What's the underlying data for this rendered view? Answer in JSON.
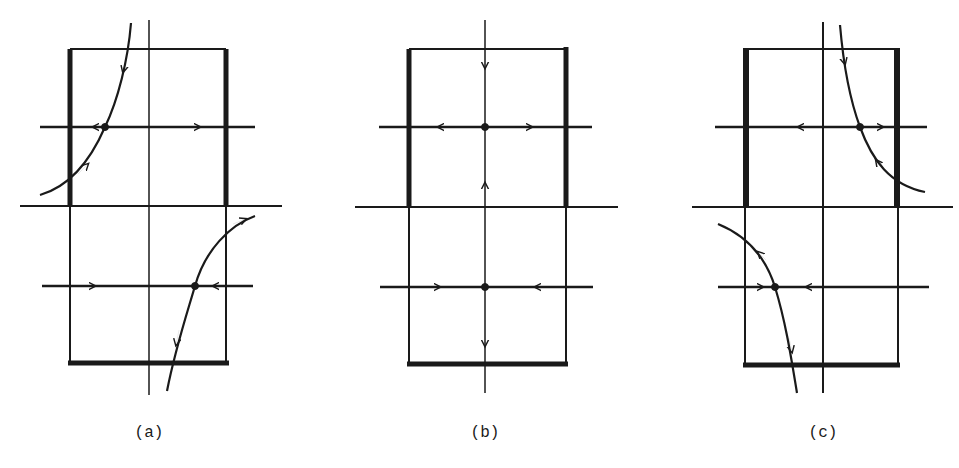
{
  "figure": {
    "panels": [
      {
        "id": "a",
        "label": "(a)",
        "label_pos": {
          "x": 149,
          "y": 424
        },
        "rect": {
          "left": 70,
          "right": 226,
          "top": 49,
          "mid": 206,
          "bottom": 363
        },
        "axis_x": 149,
        "thick_edges": [
          "left-upper",
          "right-upper",
          "bottom"
        ],
        "equilibria": [
          {
            "x": 105,
            "y": 127
          },
          {
            "x": 195,
            "y": 286
          }
        ],
        "description": "Upper saddle near left edge with trajectory curving down from top-left; lower saddle near right with trajectory exiting bottom"
      },
      {
        "id": "b",
        "label": "(b)",
        "label_pos": {
          "x": 485,
          "y": 424
        },
        "rect": {
          "left": 409,
          "right": 566,
          "top": 49,
          "mid": 206,
          "bottom": 363
        },
        "axis_x": 485,
        "thick_edges": [
          "left-upper",
          "right-upper",
          "bottom"
        ],
        "equilibria": [
          {
            "x": 485,
            "y": 127
          },
          {
            "x": 485,
            "y": 286
          }
        ],
        "description": "Symmetric case: both equilibria on the vertical axis"
      },
      {
        "id": "c",
        "label": "(c)",
        "label_pos": {
          "x": 823,
          "y": 424
        },
        "rect": {
          "left": 745,
          "right": 897,
          "top": 49,
          "mid": 206,
          "bottom": 363
        },
        "axis_x": 823,
        "thick_edges": [
          "left-upper",
          "right-upper",
          "bottom"
        ],
        "equilibria": [
          {
            "x": 860,
            "y": 127
          },
          {
            "x": 775,
            "y": 286
          }
        ],
        "description": "Mirror of (a): upper saddle near right edge, lower saddle near left"
      }
    ],
    "colors": {
      "ink": "#1a1a1a",
      "background": "#ffffff"
    }
  }
}
